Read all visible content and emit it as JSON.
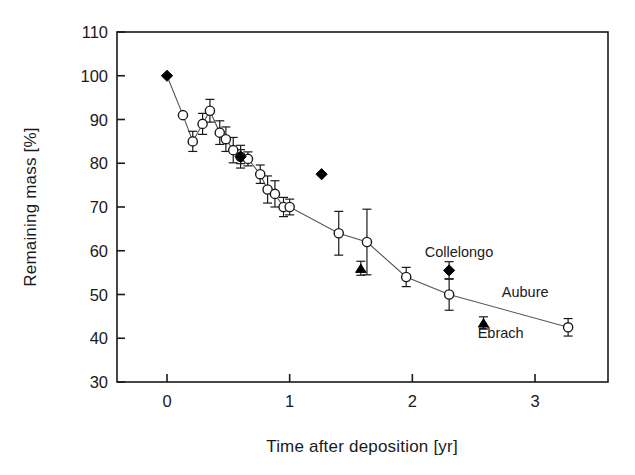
{
  "chart_data": {
    "type": "scatter",
    "title": "",
    "xlabel": "Time after deposition [yr]",
    "ylabel": "Remaining mass [%]",
    "xlim": [
      -0.35,
      3.45
    ],
    "ylim": [
      30,
      110
    ],
    "xticks": [
      0,
      1,
      2,
      3
    ],
    "yticks": [
      30,
      40,
      50,
      60,
      70,
      80,
      90,
      100,
      110
    ],
    "xtick_labels": [
      "0",
      "1",
      "2",
      "3"
    ],
    "ytick_labels": [
      "30",
      "40",
      "50",
      "60",
      "70",
      "80",
      "90",
      "100",
      "110"
    ],
    "grid": false,
    "legend": "none",
    "annotations": [
      {
        "text": "Collelongo",
        "x": 2.38,
        "y": 58.5
      },
      {
        "text": "Aubure",
        "x": 2.92,
        "y": 49.5
      },
      {
        "text": "Ebrach",
        "x": 2.72,
        "y": 40.0
      }
    ],
    "series": [
      {
        "name": "Aubure",
        "marker": "open-circle",
        "connected": true,
        "points": [
          {
            "x": 0.13,
            "y": 91.0,
            "err": 0.0
          },
          {
            "x": 0.21,
            "y": 85.0,
            "err": 2.3
          },
          {
            "x": 0.29,
            "y": 89.0,
            "err": 2.4
          },
          {
            "x": 0.35,
            "y": 92.0,
            "err": 2.6
          },
          {
            "x": 0.43,
            "y": 87.0,
            "err": 2.7
          },
          {
            "x": 0.48,
            "y": 85.5,
            "err": 2.8
          },
          {
            "x": 0.54,
            "y": 83.0,
            "err": 2.9
          },
          {
            "x": 0.6,
            "y": 81.5,
            "err": 2.6
          },
          {
            "x": 0.66,
            "y": 81.0,
            "err": 1.6
          },
          {
            "x": 0.76,
            "y": 77.5,
            "err": 2.1
          },
          {
            "x": 0.82,
            "y": 74.0,
            "err": 3.1
          },
          {
            "x": 0.88,
            "y": 73.0,
            "err": 3.0
          },
          {
            "x": 0.95,
            "y": 70.0,
            "err": 2.2
          },
          {
            "x": 1.0,
            "y": 70.0,
            "err": 1.8
          },
          {
            "x": 1.4,
            "y": 64.0,
            "err": 5.0
          },
          {
            "x": 1.63,
            "y": 62.0,
            "err": 7.5
          },
          {
            "x": 1.95,
            "y": 54.0,
            "err": 2.2
          },
          {
            "x": 2.3,
            "y": 50.0,
            "err": 3.6
          },
          {
            "x": 3.27,
            "y": 42.5,
            "err": 2.0
          }
        ]
      },
      {
        "name": "Collelongo",
        "marker": "filled-diamond",
        "connected": false,
        "points": [
          {
            "x": 0.0,
            "y": 100.0,
            "err": 0.0
          },
          {
            "x": 0.6,
            "y": 81.5,
            "err": 1.6
          },
          {
            "x": 1.26,
            "y": 77.5,
            "err": 0.0
          },
          {
            "x": 2.3,
            "y": 55.5,
            "err": 2.0
          }
        ]
      },
      {
        "name": "Ebrach",
        "marker": "filled-triangle",
        "connected": false,
        "points": [
          {
            "x": 1.58,
            "y": 56.0,
            "err": 1.6
          },
          {
            "x": 2.58,
            "y": 43.5,
            "err": 1.4
          }
        ]
      }
    ]
  },
  "axes": {
    "x_title": "Time after deposition [yr]",
    "y_title": "Remaining mass [%]"
  }
}
